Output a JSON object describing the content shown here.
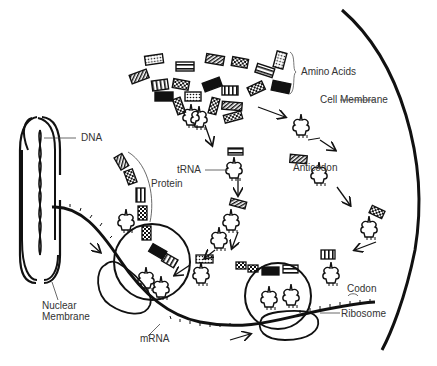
{
  "diagram": {
    "labels": {
      "dna": "DNA",
      "amino_acids": "Amino Acids",
      "cell_membrane": "Cell Membrane",
      "trna": "tRNA",
      "protein": "Protein",
      "anticodon": "Anticodon",
      "nuclear_membrane_line1": "Nuclear",
      "nuclear_membrane_line2": "Membrane",
      "mrna": "mRNA",
      "codon": "Codon",
      "ribosome": "Ribosome"
    },
    "colors": {
      "line": "#111111",
      "text": "#333333",
      "background": "#ffffff"
    }
  }
}
